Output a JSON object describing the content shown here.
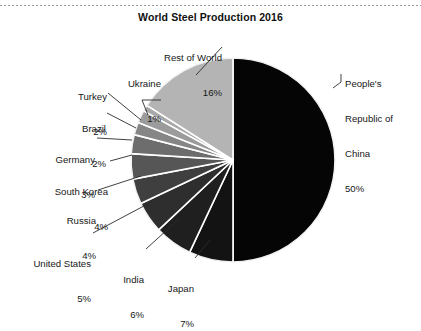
{
  "page": {
    "background_color": "#ffffff",
    "width": 421,
    "height": 290
  },
  "chart_data": {
    "type": "pie",
    "title": "World Steel Production 2016",
    "subtitle": "",
    "xlabel": "",
    "ylabel": "",
    "legend_position": "none",
    "labels_outside": true,
    "value_unit": "%",
    "total": 100,
    "categories": [
      "People's Republic of China",
      "Japan",
      "India",
      "United States",
      "Russia",
      "South Korea",
      "Germany",
      "Brazil",
      "Turkey",
      "Ukraine",
      "Rest of World"
    ],
    "values": [
      50,
      7,
      6,
      5,
      4,
      4,
      3,
      2,
      2,
      1,
      16
    ],
    "slices": [
      {
        "name": "People's Republic of China",
        "label_lines": [
          "People's",
          "Republic of",
          "China"
        ],
        "percent": 50,
        "percent_text": "50%",
        "color": "#050505"
      },
      {
        "name": "Japan",
        "label_lines": [
          "Japan"
        ],
        "percent": 7,
        "percent_text": "7%",
        "color": "#131313"
      },
      {
        "name": "India",
        "label_lines": [
          "India"
        ],
        "percent": 6,
        "percent_text": "6%",
        "color": "#1f1f1f"
      },
      {
        "name": "United States",
        "label_lines": [
          "United States"
        ],
        "percent": 5,
        "percent_text": "5%",
        "color": "#2e2e2e"
      },
      {
        "name": "Russia",
        "label_lines": [
          "Russia"
        ],
        "percent": 4,
        "percent_text": "4%",
        "color": "#3f3f3f"
      },
      {
        "name": "South Korea",
        "label_lines": [
          "South Korea"
        ],
        "percent": 4,
        "percent_text": "4%",
        "color": "#565656"
      },
      {
        "name": "Germany",
        "label_lines": [
          "Germany"
        ],
        "percent": 3,
        "percent_text": "3%",
        "color": "#6d6d6d"
      },
      {
        "name": "Brazil",
        "label_lines": [
          "Brazil"
        ],
        "percent": 2,
        "percent_text": "2%",
        "color": "#868686"
      },
      {
        "name": "Turkey",
        "label_lines": [
          "Turkey"
        ],
        "percent": 2,
        "percent_text": "2%",
        "color": "#9b9b9b"
      },
      {
        "name": "Ukraine",
        "label_lines": [
          "Ukraine"
        ],
        "percent": 1,
        "percent_text": "1%",
        "color": "#a8a8a8"
      },
      {
        "name": "Rest of World",
        "label_lines": [
          "Rest of World"
        ],
        "percent": 16,
        "percent_text": "16%",
        "color": "#b4b4b4"
      }
    ],
    "geometry": {
      "center_x": 233,
      "center_y": 160,
      "radius": 102,
      "start_angle_deg": 0,
      "direction": "china-clockwise-others-counterclockwise",
      "separator_color": "#ffffff",
      "separator_width": 1.6
    }
  },
  "labels": {
    "china": {
      "name": "People's",
      "line2": "Republic of",
      "line3": "China",
      "percent": "50%"
    },
    "row": {
      "rest_of_world": "Rest of World",
      "rest_of_world_pct": "16%",
      "ukraine": "Ukraine",
      "ukraine_pct": "1%",
      "turkey": "Turkey",
      "turkey_pct": "2%",
      "brazil": "Brazil",
      "brazil_pct": "2%",
      "germany": "Germany",
      "germany_pct": "3%",
      "south_korea": "South Korea",
      "south_korea_pct": "4%",
      "russia": "Russia",
      "russia_pct": "4%",
      "united_states": "United States",
      "united_states_pct": "5%",
      "india": "India",
      "india_pct": "6%",
      "japan": "Japan",
      "japan_pct": "7%"
    }
  }
}
